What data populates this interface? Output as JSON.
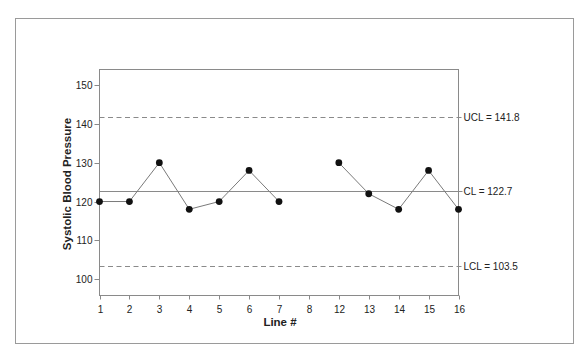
{
  "chart_data": {
    "type": "line",
    "title": "",
    "xlabel": "Line #",
    "ylabel": "Systolic Blood Pressure",
    "categories": [
      "1",
      "2",
      "3",
      "4",
      "5",
      "6",
      "7",
      "8",
      "12",
      "13",
      "14",
      "15",
      "16"
    ],
    "series": [
      {
        "name": "Systolic Blood Pressure",
        "values": [
          120,
          120,
          130,
          118,
          120,
          128,
          120,
          null,
          130,
          122,
          118,
          128,
          118
        ]
      }
    ],
    "control_limits": [
      {
        "name": "UCL",
        "value": 141.8,
        "label": "UCL = 141.8",
        "style": "dashed"
      },
      {
        "name": "CL",
        "value": 122.7,
        "label": "CL = 122.7",
        "style": "solid"
      },
      {
        "name": "LCL",
        "value": 103.5,
        "label": "LCL = 103.5",
        "style": "dashed"
      }
    ],
    "yticks": [
      100,
      110,
      120,
      130,
      140,
      150
    ],
    "ylim": [
      95.8,
      154.0
    ],
    "grid": false,
    "legend": null,
    "colors": {
      "frame": "#9a9a9a",
      "axis": "#8a8a8a",
      "series_line": "#7a7a7a",
      "marker": "#111111",
      "limit_line": "#8a8a8a"
    }
  }
}
